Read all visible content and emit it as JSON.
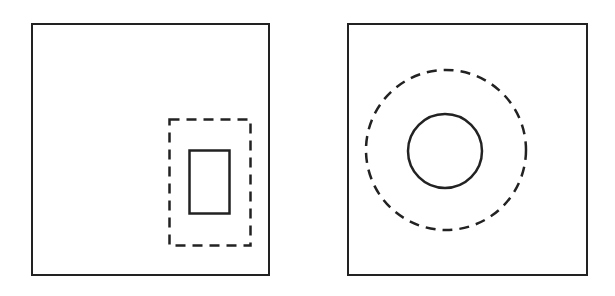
{
  "diagram": {
    "stroke_color": "#222222",
    "background": "#ffffff",
    "panels": [
      {
        "id": "left",
        "frame": {
          "x": 32,
          "y": 24,
          "w": 237,
          "h": 251
        },
        "outer_dashed_shape": {
          "type": "rect",
          "x": 169,
          "y": 119,
          "w": 81,
          "h": 126
        },
        "inner_solid_shape": {
          "type": "rect",
          "x": 189,
          "y": 150,
          "w": 40,
          "h": 63
        }
      },
      {
        "id": "right",
        "frame": {
          "x": 348,
          "y": 24,
          "w": 239,
          "h": 251
        },
        "outer_dashed_shape": {
          "type": "circle",
          "cx": 446,
          "cy": 150,
          "r": 80
        },
        "inner_solid_shape": {
          "type": "circle",
          "cx": 445,
          "cy": 151,
          "r": 37
        }
      }
    ]
  }
}
